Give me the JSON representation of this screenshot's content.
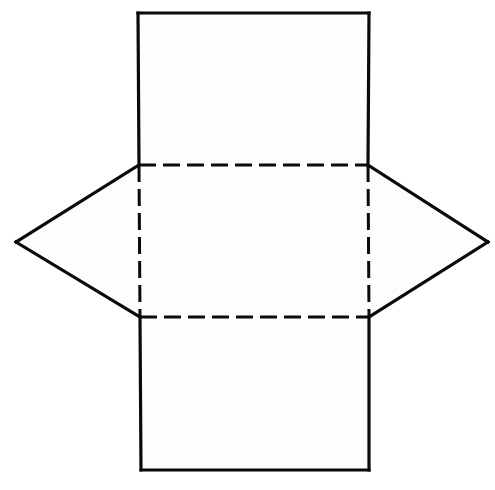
{
  "figure": {
    "type": "geometric-net",
    "background_color": "#ffffff",
    "stroke_color": "#0a0a0a",
    "face_fill_color": "#fdfdfd",
    "solid_stroke_width": 3.2,
    "dashed_stroke_width": 3.0,
    "dash_pattern": "17 7",
    "canvas": {
      "width": 495,
      "height": 490
    }
  },
  "geometry": {
    "points": {
      "top_left": {
        "x": 138,
        "y": 13
      },
      "top_right": {
        "x": 369,
        "y": 13
      },
      "upper_left_junction": {
        "x": 139,
        "y": 165
      },
      "upper_right_junction": {
        "x": 368,
        "y": 165
      },
      "left_vertex": {
        "x": 16,
        "y": 242
      },
      "right_vertex": {
        "x": 488,
        "y": 242
      },
      "lower_left_junction": {
        "x": 140,
        "y": 317
      },
      "lower_right_junction": {
        "x": 369,
        "y": 317
      },
      "bottom_left": {
        "x": 141,
        "y": 470
      },
      "bottom_right": {
        "x": 369,
        "y": 470
      }
    },
    "faces": [
      {
        "name": "top-square-face",
        "style": "solid",
        "points": "138,13 369,13 368,165 139,165"
      },
      {
        "name": "center-square-face",
        "style": "dashed",
        "points": "139,165 368,165 369,317 140,317"
      },
      {
        "name": "bottom-square-face",
        "style": "solid",
        "points": "140,317 369,317 369,470 141,470"
      },
      {
        "name": "left-triangle-face",
        "style": "solid",
        "points": "139,165 16,242 140,317"
      },
      {
        "name": "right-triangle-face",
        "style": "solid",
        "points": "368,165 488,242 369,317"
      }
    ],
    "solid_edges": [
      {
        "name": "top-face-left-edge",
        "d": "M 138,13 L 139,165"
      },
      {
        "name": "top-face-top-edge",
        "d": "M 138,13 L 369,13"
      },
      {
        "name": "top-face-right-edge",
        "d": "M 369,13 L 368,165"
      },
      {
        "name": "left-triangle-upper-edge",
        "d": "M 139,165 L 16,242"
      },
      {
        "name": "left-triangle-lower-edge",
        "d": "M 16,242 L 140,317"
      },
      {
        "name": "right-triangle-upper-edge",
        "d": "M 368,165 L 488,242"
      },
      {
        "name": "right-triangle-lower-edge",
        "d": "M 488,242 L 369,317"
      },
      {
        "name": "bottom-face-left-edge",
        "d": "M 140,317 L 141,470"
      },
      {
        "name": "bottom-face-bottom-edge",
        "d": "M 141,470 L 369,470"
      },
      {
        "name": "bottom-face-right-edge",
        "d": "M 369,317 L 369,470"
      }
    ],
    "dashed_edges": [
      {
        "name": "hidden-edge-top",
        "d": "M 139,165 L 368,165"
      },
      {
        "name": "hidden-edge-bottom",
        "d": "M 140,317 L 369,317"
      },
      {
        "name": "hidden-edge-left",
        "d": "M 139,165 L 140,317"
      },
      {
        "name": "hidden-edge-right",
        "d": "M 368,165 L 369,317"
      }
    ]
  }
}
